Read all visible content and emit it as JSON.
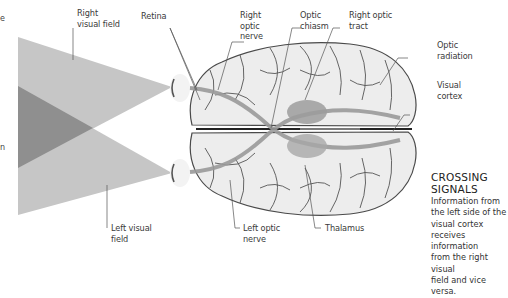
{
  "diagram": {
    "colors": {
      "field_light": "#c4c4c4",
      "field_overlap": "#8e8e8e",
      "brain_fill": "#ececec",
      "brain_outline": "#4a4a4a",
      "pathway": "#9a9a9a",
      "label_text": "#3a3a3a",
      "leader_line": "#555555"
    },
    "labels": {
      "right_visual_field": "Right\nvisual field",
      "retina": "Retina",
      "right_optic_nerve": "Right\noptic\nnerve",
      "optic_chiasm": "Optic\nchiasm",
      "right_optic_tract": "Right optic\ntract",
      "optic_radiation": "Optic\nradiation",
      "visual_cortex": "Visual\ncortex",
      "left_visual_field": "Left visual\nfield",
      "left_optic_nerve": "Left optic\nnerve",
      "thalamus": "Thalamus"
    },
    "cut_off_text": {
      "top_left": "e",
      "mid_left": "n"
    },
    "sidebar": {
      "title": "CROSSING\nSIGNALS",
      "body": "Information from\nthe left side of the\nvisual cortex\nreceives information\nfrom the right visual\nfield and vice versa."
    }
  }
}
